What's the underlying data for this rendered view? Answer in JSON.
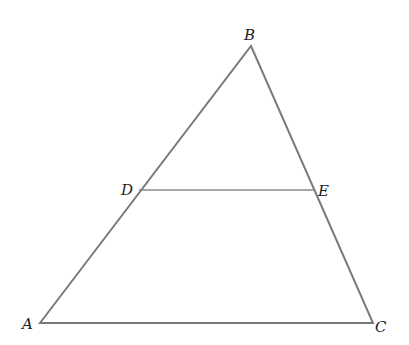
{
  "diagram": {
    "type": "triangle-with-midsegment",
    "points": {
      "A": {
        "label": "A",
        "x": 40,
        "y": 323
      },
      "B": {
        "label": "B",
        "x": 251,
        "y": 46
      },
      "C": {
        "label": "C",
        "x": 373,
        "y": 323
      },
      "D": {
        "label": "D",
        "x": 139,
        "y": 190
      },
      "E": {
        "label": "E",
        "x": 315,
        "y": 190
      }
    },
    "segments": [
      "AB",
      "BC",
      "CA",
      "DE"
    ],
    "colors": {
      "line": "#7a7a7a",
      "label": "#222222"
    }
  }
}
